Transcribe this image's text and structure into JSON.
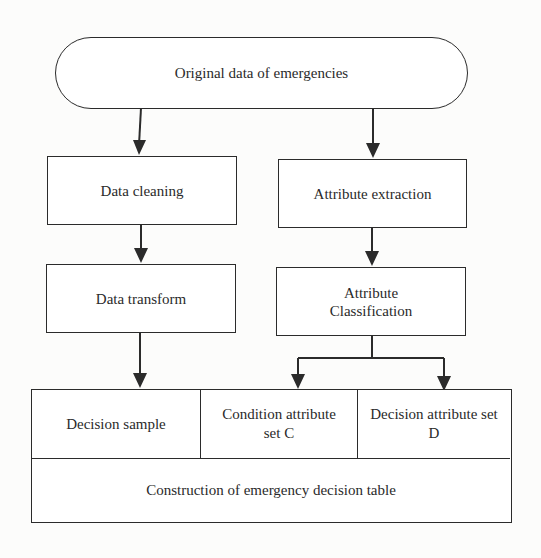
{
  "diagram": {
    "type": "flowchart",
    "start": {
      "label": "Original data of emergencies",
      "shape": "terminal"
    },
    "left_branch": [
      {
        "label": "Data cleaning"
      },
      {
        "label": "Data transform"
      }
    ],
    "right_branch": [
      {
        "label": "Attribute extraction"
      },
      {
        "label_line1": "Attribute",
        "label_line2": "Classification"
      }
    ],
    "decision_table": {
      "columns": [
        {
          "label": "Decision sample"
        },
        {
          "label_line1": "Condition attribute",
          "label_line2": "set C"
        },
        {
          "label_line1": "Decision attribute set",
          "label_line2": "D"
        }
      ],
      "footer": {
        "label": "Construction of emergency decision table"
      }
    },
    "edges": [
      {
        "from": "Original data of emergencies",
        "to": "Data cleaning"
      },
      {
        "from": "Original data of emergencies",
        "to": "Attribute extraction"
      },
      {
        "from": "Data cleaning",
        "to": "Data transform"
      },
      {
        "from": "Attribute extraction",
        "to": "Attribute Classification"
      },
      {
        "from": "Data transform",
        "to": "Decision sample"
      },
      {
        "from": "Attribute Classification",
        "to": "Condition attribute set C"
      },
      {
        "from": "Attribute Classification",
        "to": "Decision attribute set D"
      }
    ],
    "colors": {
      "stroke": "#2b2b2b",
      "text": "#2a2a2a",
      "background": "#fcfcfb",
      "node_fill": "#ffffff"
    }
  }
}
